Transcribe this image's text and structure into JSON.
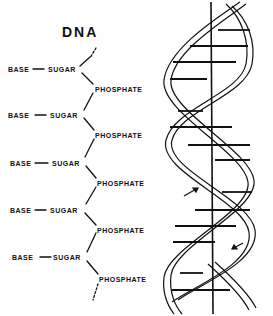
{
  "title": "DNA",
  "chain": {
    "units": [
      {
        "base": "BASE",
        "sugar": "SUGAR",
        "phosphate": "PHOSPHATE"
      },
      {
        "base": "BASE",
        "sugar": "SUGAR",
        "phosphate": "PHOSPHATE"
      },
      {
        "base": "BASE",
        "sugar": "SUGAR",
        "phosphate": "PHOSPHATE"
      },
      {
        "base": "BASE",
        "sugar": "SUGAR",
        "phosphate": "PHOSPHATE"
      },
      {
        "base": "BASE",
        "sugar": "SUGAR",
        "phosphate": "PHOSPHATE"
      }
    ]
  },
  "helix": {
    "description": "double helix with base-pair rungs, central axis and direction arrows",
    "strand_color": "#111111",
    "background": "#ffffff"
  }
}
